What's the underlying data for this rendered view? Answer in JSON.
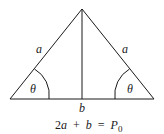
{
  "diagram": {
    "type": "isosceles-triangle",
    "side_labels": {
      "left": "a",
      "right": "a",
      "base": "b"
    },
    "angle_labels": {
      "left": "θ",
      "right": "θ"
    },
    "equation": {
      "lhs_coef": "2",
      "lhs_var": "a",
      "plus": "+",
      "term2": "b",
      "equals": "=",
      "rhs_var": "P",
      "rhs_sub": "0"
    },
    "colors": {
      "stroke": "#1a1a1a",
      "background": "#ffffff"
    }
  }
}
